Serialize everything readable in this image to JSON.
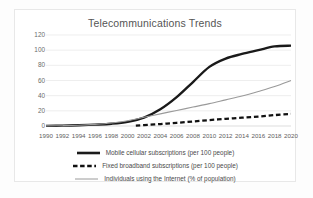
{
  "chart_data": {
    "type": "line",
    "title": "Telecommunications Trends",
    "xlabel": "",
    "ylabel": "",
    "grid": true,
    "legend_position": "bottom",
    "xlim": [
      1990,
      2020
    ],
    "ylim": [
      0,
      120
    ],
    "yticks": [
      0,
      20,
      40,
      60,
      80,
      100,
      120
    ],
    "categories": [
      1990,
      1992,
      1994,
      1996,
      1998,
      2000,
      2002,
      2004,
      2006,
      2008,
      2010,
      2012,
      2014,
      2016,
      2018,
      2020
    ],
    "xtick_labels": [
      "1990",
      "1992",
      "1994",
      "1996",
      "1998",
      "2000",
      "2002",
      "2004",
      "2006",
      "2008",
      "2010",
      "2012",
      "2014",
      "2016",
      "2018",
      "2020"
    ],
    "series": [
      {
        "name": "Mobile cellular subscriptions (per 100 people)",
        "style": "solid-thick",
        "color": "#1a1a1a",
        "x": [
          1990,
          1992,
          1994,
          1996,
          1998,
          2000,
          2002,
          2004,
          2006,
          2008,
          2010,
          2012,
          2014,
          2016,
          2018,
          2020
        ],
        "values": [
          0.2,
          0.5,
          1.0,
          1.8,
          3.0,
          5.5,
          11,
          22,
          38,
          58,
          78,
          89,
          95,
          100,
          105,
          106
        ]
      },
      {
        "name": "Fixed broadband subscriptions (per 100 people)",
        "style": "dashed",
        "color": "#111111",
        "x": [
          2001,
          2002,
          2004,
          2006,
          2008,
          2010,
          2012,
          2014,
          2016,
          2018,
          2020
        ],
        "values": [
          0.6,
          1.2,
          2.6,
          4.2,
          6.0,
          7.8,
          9.4,
          11.0,
          12.4,
          14.4,
          16.0
        ]
      },
      {
        "name": "Individuals using the Internet (% of population)",
        "style": "solid-thin",
        "color": "#9a9a9a",
        "x": [
          1990,
          1992,
          1994,
          1996,
          1998,
          2000,
          2002,
          2004,
          2006,
          2008,
          2010,
          2012,
          2014,
          2016,
          2018,
          2020
        ],
        "values": [
          0.1,
          0.4,
          1.0,
          2.2,
          4.0,
          7.0,
          11.5,
          16.0,
          20.5,
          25.0,
          29.5,
          34.5,
          39.5,
          45.5,
          52.0,
          60.0
        ]
      }
    ]
  },
  "legend": {
    "items": [
      {
        "label": "Mobile cellular subscriptions (per 100 people)",
        "marker": "solid-thick-line-icon"
      },
      {
        "label": "Fixed broadband subscriptions (per 100 people)",
        "marker": "dashed-line-icon"
      },
      {
        "label": "Individuals using the Internet (% of population)",
        "marker": "thin-line-icon"
      }
    ]
  },
  "colors": {
    "mobile": "#1a1a1a",
    "broadband": "#111111",
    "internet": "#9a9a9a",
    "grid": "#e2e2e2",
    "axis_text": "#5e5e5e",
    "title_text": "#555555",
    "frame": "#e8e8e8"
  }
}
